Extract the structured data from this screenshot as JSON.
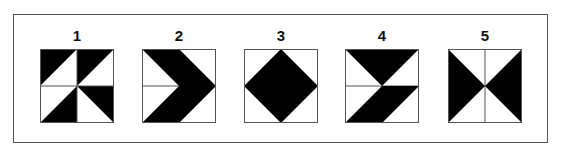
{
  "figures": [
    {
      "label": "1",
      "pattern": "pinwheel-quadrant-triangles"
    },
    {
      "label": "2",
      "pattern": "chevron-right"
    },
    {
      "label": "3",
      "pattern": "diamond"
    },
    {
      "label": "4",
      "pattern": "triangle-over-parallelogram"
    },
    {
      "label": "5",
      "pattern": "bowtie"
    }
  ],
  "colors": {
    "fill": "#000000",
    "line": "#555555",
    "background": "#ffffff"
  }
}
